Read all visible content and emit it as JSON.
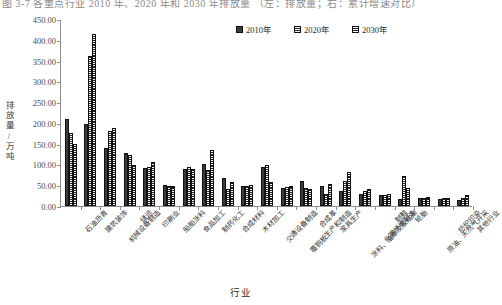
{
  "caption_strip": "图 3-7 各重点行业 2010 年、2020 年和 2030 年排放量 （左：排放量；右：累计增速对比）",
  "legend": {
    "position": "top-right",
    "items": [
      {
        "label": "2010年",
        "pattern": "solid-dark"
      },
      {
        "label": "2020年",
        "pattern": "horizontal-hatch"
      },
      {
        "label": "2030年",
        "pattern": "dense-hatch"
      }
    ]
  },
  "axes": {
    "ylabel": "排放量/万吨",
    "xlabel": "行业",
    "yticks": [
      "0.00",
      "50.00",
      "100.00",
      "150.00",
      "200.00",
      "250.00",
      "300.00",
      "350.00",
      "400.00",
      "450.00"
    ]
  },
  "chart_data": {
    "type": "bar",
    "title": "",
    "xlabel": "行业",
    "ylabel": "排放量/万吨",
    "ylim": [
      0,
      450
    ],
    "ytick_step": 50,
    "grid": false,
    "legend_position": "top-right",
    "categories": [
      "石油沥青",
      "建筑装饰",
      "机械设备制造",
      "储运",
      "印刷业",
      "船舶涂料",
      "食品加工",
      "制药化工",
      "合成材料",
      "木材加工",
      "交通设备制造",
      "覆铜板生产和制造",
      "合成革",
      "家具生产",
      "涂料、油墨及胶粘剂",
      "化学纤维制造",
      "制鞋",
      "轮胎",
      "原油、天然气开采",
      "纺织印染",
      "其他行业"
    ],
    "series": [
      {
        "name": "2010年",
        "values": [
          210,
          198,
          140,
          127,
          92,
          50,
          88,
          101,
          68,
          47,
          95,
          44,
          59,
          47,
          36,
          30,
          27,
          17,
          19,
          16,
          14
        ]
      },
      {
        "name": "2020年",
        "values": [
          175,
          362,
          180,
          122,
          93,
          48,
          94,
          86,
          42,
          48,
          98,
          45,
          44,
          30,
          60,
          37,
          27,
          72,
          20,
          19,
          19
        ]
      },
      {
        "name": "2030年",
        "values": [
          150,
          415,
          187,
          98,
          107,
          48,
          90,
          135,
          58,
          50,
          58,
          48,
          40,
          52,
          82,
          42,
          28,
          44,
          22,
          20,
          26
        ]
      }
    ]
  }
}
